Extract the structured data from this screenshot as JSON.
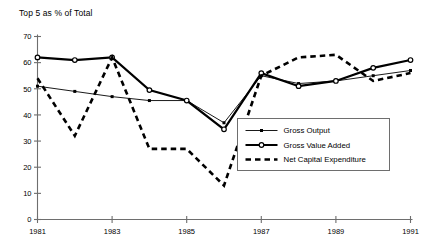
{
  "chart_data": {
    "type": "line",
    "title": "Top 5 as % of Total",
    "xlabel": "",
    "ylabel": "",
    "xlim": [
      1981,
      1991
    ],
    "ylim": [
      0,
      70
    ],
    "ytick_step": 10,
    "yticks": [
      "0",
      "10",
      "20",
      "30",
      "40",
      "50",
      "60",
      "70"
    ],
    "ytick_values": [
      0,
      10,
      20,
      30,
      40,
      50,
      60,
      70
    ],
    "xticks": [
      "1981",
      "1983",
      "1985",
      "1987",
      "1989",
      "1991"
    ],
    "xtick_values": [
      1981,
      1983,
      1985,
      1987,
      1989,
      1991
    ],
    "x": [
      1981,
      1982,
      1983,
      1984,
      1985,
      1986,
      1987,
      1988,
      1989,
      1990,
      1991
    ],
    "grid": false,
    "legend_position": "center-right",
    "series": [
      {
        "name": "Gross Output",
        "style": "thin-solid-square",
        "color": "#000000",
        "values": [
          51,
          49,
          47,
          45.5,
          45.5,
          37,
          55,
          52,
          53,
          55,
          57
        ]
      },
      {
        "name": "Gross Value Added",
        "style": "thick-solid-circle",
        "color": "#000000",
        "values": [
          62,
          61,
          62,
          49.5,
          45.5,
          34.5,
          56,
          51,
          53,
          58,
          61
        ]
      },
      {
        "name": "Net Capital Expenditure",
        "style": "thick-dashed",
        "color": "#000000",
        "values": [
          54,
          32,
          62,
          27,
          27,
          13,
          55,
          62,
          63,
          53,
          56
        ]
      }
    ]
  },
  "legend": {
    "items": [
      {
        "label": "Gross Output"
      },
      {
        "label": "Gross Value Added"
      },
      {
        "label": "Net Capital Expenditure"
      }
    ]
  }
}
